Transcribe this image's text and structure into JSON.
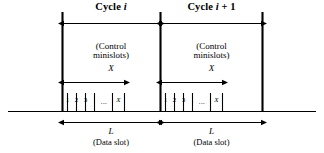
{
  "figure": {
    "type": "timing-diagram",
    "background_color": "#ffffff",
    "line_color": "#000000"
  },
  "cycles": [
    {
      "id": "cycle-i",
      "title_prefix": "Cycle ",
      "title_symbol": "i",
      "title_suffix": "",
      "control_label_line1": "(Control",
      "control_label_line2": "minislots)",
      "control_symbol": "X",
      "data_symbol": "L",
      "data_label": "(Data slot)",
      "minislots": [
        "1",
        "2",
        "3"
      ],
      "minislot_ellipsis": "...",
      "minislot_last": "X"
    },
    {
      "id": "cycle-i-plus-1",
      "title_prefix": "Cycle ",
      "title_symbol": "i",
      "title_suffix": " + 1",
      "control_label_line1": "(Control",
      "control_label_line2": "minislots)",
      "control_symbol": "X",
      "data_symbol": "L",
      "data_label": "(Data slot)",
      "minislots": [
        "1",
        "2",
        "3"
      ],
      "minislot_ellipsis": "...",
      "minislot_last": "X"
    }
  ]
}
